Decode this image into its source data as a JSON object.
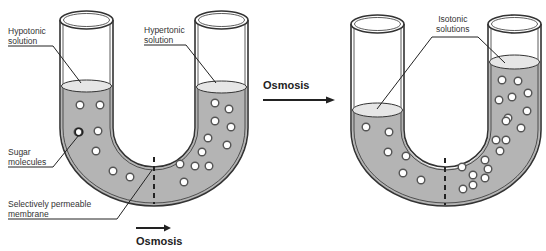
{
  "labels": {
    "hypotonic_line1": "Hypotonic",
    "hypotonic_line2": "solution",
    "hypertonic_line1": "Hypertonic",
    "hypertonic_line2": "solution",
    "sugar_line1": "Sugar",
    "sugar_line2": "molecules",
    "membrane_line1": "Selectively permeable",
    "membrane_line2": "membrane",
    "isotonic_line1": "Isotonic",
    "isotonic_line2": "solutions",
    "osmosis_middle": "Osmosis",
    "osmosis_bottom": "Osmosis"
  },
  "colors": {
    "liquid": "#b4b4b4",
    "liquid_surface": "#e6e6e6",
    "outline": "#333333",
    "molecule_fill": "#ffffff"
  }
}
